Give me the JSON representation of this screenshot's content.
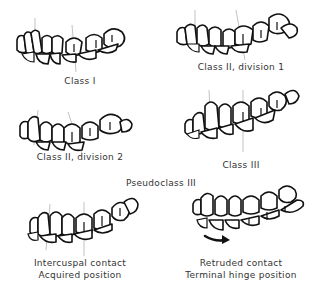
{
  "figure": {
    "panels": [
      {
        "id": "class-1",
        "label": "Class I"
      },
      {
        "id": "class-2-div-1",
        "label": "Class II, division 1"
      },
      {
        "id": "class-2-div-2",
        "label": "Class II, division 2"
      },
      {
        "id": "class-3",
        "label": "Class III"
      },
      {
        "id": "intercuspal",
        "label_line1": "Intercuspal contact",
        "label_line2": "Acquired position"
      },
      {
        "id": "retruded",
        "label_line1": "Retruded contact",
        "label_line2": "Terminal hinge position"
      }
    ],
    "section_heading": "Pseudoclass III",
    "colors": {
      "line": "#111111",
      "guide": "#999999",
      "text": "#333333",
      "background": "#ffffff"
    },
    "icons": {
      "arrow": "curved-arrow-right"
    }
  }
}
